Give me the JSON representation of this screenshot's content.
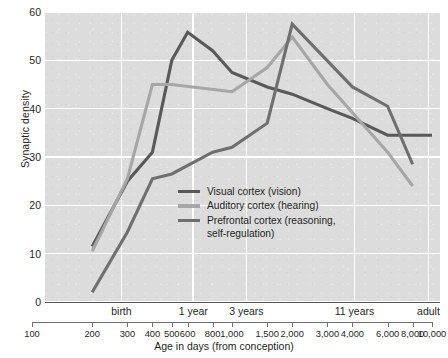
{
  "chart_data": {
    "type": "line",
    "title": "",
    "xlabel": "Age in days (from conception)",
    "ylabel": "Synaptic density",
    "xscale": "log",
    "xlim": [
      100,
      10000
    ],
    "ylim": [
      0,
      60
    ],
    "grid": true,
    "legend_position": "inside-center-left",
    "ytick_labels": [
      "0",
      "10",
      "20",
      "30",
      "40",
      "50",
      "60"
    ],
    "ytick_values": [
      0,
      10,
      20,
      30,
      40,
      50,
      60
    ],
    "xtick_labels": [
      "100",
      "200",
      "300",
      "400",
      "500",
      "600",
      "800",
      "1,000",
      "1,500",
      "2,000",
      "3,000",
      "4,000",
      "6,000",
      "8,000",
      "10,000"
    ],
    "xtick_values": [
      100,
      200,
      300,
      400,
      500,
      600,
      800,
      1000,
      1500,
      2000,
      3000,
      4000,
      6000,
      8000,
      10000
    ],
    "era_labels": [
      {
        "label": "birth",
        "x": 280
      },
      {
        "label": "1 year",
        "x": 640
      },
      {
        "label": "3 years",
        "x": 1180
      },
      {
        "label": "11 years",
        "x": 4100
      },
      {
        "label": "adult",
        "x": 9600
      }
    ],
    "gridlines_x": [
      280,
      640,
      1180,
      4100,
      9600
    ],
    "series": [
      {
        "name": "Visual cortex (vision)",
        "color": "#595959",
        "x": [
          200,
          300,
          400,
          500,
          600,
          800,
          1000,
          1500,
          2000,
          3000,
          4000,
          6000,
          8000,
          10000
        ],
        "values": [
          11.5,
          25,
          31,
          50,
          55.8,
          52,
          47.5,
          44.5,
          43,
          40,
          38,
          34.5,
          34.5,
          34.5
        ]
      },
      {
        "name": "Auditory cortex (hearing)",
        "color": "#a6a6a6",
        "x": [
          200,
          300,
          400,
          500,
          1000,
          1500,
          2000,
          3000,
          6000,
          8000
        ],
        "values": [
          10.5,
          25.5,
          45,
          45,
          43.5,
          48.5,
          54.8,
          45,
          31,
          24
        ]
      },
      {
        "name": "Prefrontal cortex (reasoning,\nself-regulation)",
        "color": "#6f6f6f",
        "x": [
          200,
          300,
          400,
          500,
          800,
          1000,
          1500,
          2000,
          4000,
          6000,
          8000
        ],
        "values": [
          2,
          14.5,
          25.5,
          26.5,
          31,
          32,
          37,
          57.5,
          44.5,
          40.5,
          28.5
        ]
      }
    ]
  }
}
